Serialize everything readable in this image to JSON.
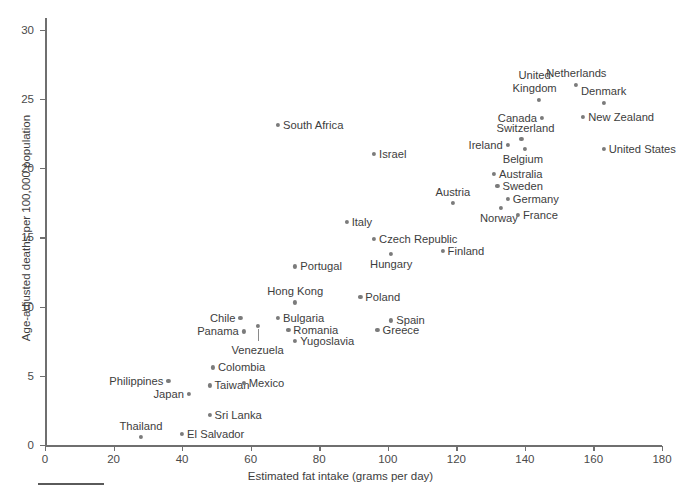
{
  "chart_data": {
    "type": "scatter",
    "title": "",
    "xlabel": "Estimated fat intake (grams per day)",
    "ylabel": "Age-adjusted deaths per 100,000 population",
    "xlim": [
      0,
      180
    ],
    "ylim": [
      0,
      31
    ],
    "xticks": [
      0,
      20,
      40,
      60,
      80,
      100,
      120,
      140,
      160,
      180
    ],
    "yticks": [
      0,
      5,
      10,
      15,
      20,
      25,
      30
    ],
    "xtick_labels": [
      "0",
      "20",
      "40",
      "60",
      "80",
      "100",
      "120",
      "140",
      "160",
      "180"
    ],
    "ytick_labels": [
      "0",
      "5",
      "10",
      "15",
      "20",
      "25",
      "30"
    ],
    "grid": false,
    "legend": false,
    "point_color": "#7b7b7b",
    "axis_color": "#6f6f6f",
    "points": [
      {
        "name": "Netherlands",
        "x": 155,
        "y": 26.0,
        "label_pos": "above",
        "label_dx": 0,
        "label_dy": -6
      },
      {
        "name": "Denmark",
        "x": 163,
        "y": 24.7,
        "label_pos": "above",
        "label_dx": 0,
        "label_dy": -6
      },
      {
        "name": "United Kingdom",
        "x": 144,
        "y": 24.9,
        "label_pos": "above",
        "label_dx": -4,
        "label_dy": -6
      },
      {
        "name": "New Zealand",
        "x": 157,
        "y": 23.7,
        "label_pos": "right",
        "label_dx": 5,
        "label_dy": 0
      },
      {
        "name": "Canada",
        "x": 145,
        "y": 23.6,
        "label_pos": "left",
        "label_dx": -5,
        "label_dy": 0
      },
      {
        "name": "South Africa",
        "x": 68,
        "y": 23.1,
        "label_pos": "right",
        "label_dx": 5,
        "label_dy": 0
      },
      {
        "name": "Switzerland",
        "x": 139,
        "y": 22.1,
        "label_pos": "above",
        "label_dx": 4,
        "label_dy": -5
      },
      {
        "name": "Ireland",
        "x": 135,
        "y": 21.7,
        "label_pos": "left",
        "label_dx": -5,
        "label_dy": 0
      },
      {
        "name": "United States",
        "x": 163,
        "y": 21.4,
        "label_pos": "right",
        "label_dx": 5,
        "label_dy": 0
      },
      {
        "name": "Belgium",
        "x": 140,
        "y": 21.4,
        "label_pos": "below",
        "label_dx": -2,
        "label_dy": 4
      },
      {
        "name": "Israel",
        "x": 96,
        "y": 21.0,
        "label_pos": "right",
        "label_dx": 5,
        "label_dy": 0
      },
      {
        "name": "Australia",
        "x": 131,
        "y": 19.6,
        "label_pos": "right",
        "label_dx": 5,
        "label_dy": 0
      },
      {
        "name": "Sweden",
        "x": 132,
        "y": 18.7,
        "label_pos": "right",
        "label_dx": 5,
        "label_dy": 0
      },
      {
        "name": "Germany",
        "x": 135,
        "y": 17.8,
        "label_pos": "right",
        "label_dx": 5,
        "label_dy": 0
      },
      {
        "name": "Austria",
        "x": 119,
        "y": 17.5,
        "label_pos": "above",
        "label_dx": 0,
        "label_dy": -5
      },
      {
        "name": "Norway",
        "x": 133,
        "y": 17.1,
        "label_pos": "below",
        "label_dx": -2,
        "label_dy": 4
      },
      {
        "name": "France",
        "x": 138,
        "y": 16.6,
        "label_pos": "right",
        "label_dx": 5,
        "label_dy": 0
      },
      {
        "name": "Italy",
        "x": 88,
        "y": 16.1,
        "label_pos": "right",
        "label_dx": 5,
        "label_dy": 0
      },
      {
        "name": "Czech Republic",
        "x": 96,
        "y": 14.9,
        "label_pos": "right",
        "label_dx": 5,
        "label_dy": 0
      },
      {
        "name": "Finland",
        "x": 116,
        "y": 14.0,
        "label_pos": "right",
        "label_dx": 5,
        "label_dy": 0
      },
      {
        "name": "Hungary",
        "x": 101,
        "y": 13.8,
        "label_pos": "below",
        "label_dx": 0,
        "label_dy": 4
      },
      {
        "name": "Portugal",
        "x": 73,
        "y": 12.9,
        "label_pos": "right",
        "label_dx": 5,
        "label_dy": 0
      },
      {
        "name": "Poland",
        "x": 92,
        "y": 10.7,
        "label_pos": "right",
        "label_dx": 5,
        "label_dy": 0
      },
      {
        "name": "Hong Kong",
        "x": 73,
        "y": 10.3,
        "label_pos": "above",
        "label_dx": 0,
        "label_dy": -5
      },
      {
        "name": "Spain",
        "x": 101,
        "y": 9.0,
        "label_pos": "right",
        "label_dx": 5,
        "label_dy": 0
      },
      {
        "name": "Bulgaria",
        "x": 68,
        "y": 9.2,
        "label_pos": "right",
        "label_dx": 5,
        "label_dy": 0
      },
      {
        "name": "Chile",
        "x": 57,
        "y": 9.2,
        "label_pos": "left",
        "label_dx": -5,
        "label_dy": 0
      },
      {
        "name": "Greece",
        "x": 97,
        "y": 8.3,
        "label_pos": "right",
        "label_dx": 5,
        "label_dy": 0
      },
      {
        "name": "Romania",
        "x": 71,
        "y": 8.3,
        "label_pos": "right",
        "label_dx": 5,
        "label_dy": 0
      },
      {
        "name": "Panama",
        "x": 58,
        "y": 8.2,
        "label_pos": "left",
        "label_dx": -5,
        "label_dy": 0
      },
      {
        "name": "Yugoslavia",
        "x": 73,
        "y": 7.5,
        "label_pos": "right",
        "label_dx": 5,
        "label_dy": 0
      },
      {
        "name": "Venezuela",
        "x": 62,
        "y": 8.6,
        "label_pos": "below",
        "label_dx": 0,
        "label_dy": 18,
        "leader": true
      },
      {
        "name": "Colombia",
        "x": 49,
        "y": 5.6,
        "label_pos": "right",
        "label_dx": 5,
        "label_dy": 0
      },
      {
        "name": "Philippines",
        "x": 36,
        "y": 4.6,
        "label_pos": "left",
        "label_dx": -5,
        "label_dy": 0
      },
      {
        "name": "Taiwan",
        "x": 48,
        "y": 4.3,
        "label_pos": "right",
        "label_dx": 5,
        "label_dy": 0
      },
      {
        "name": "Mexico",
        "x": 58,
        "y": 4.5,
        "label_pos": "right",
        "label_dx": 5,
        "label_dy": 0
      },
      {
        "name": "Japan",
        "x": 42,
        "y": 3.7,
        "label_pos": "left",
        "label_dx": -5,
        "label_dy": 0
      },
      {
        "name": "Sri Lanka",
        "x": 48,
        "y": 2.2,
        "label_pos": "right",
        "label_dx": 5,
        "label_dy": 0
      },
      {
        "name": "El Salvador",
        "x": 40,
        "y": 0.8,
        "label_pos": "right",
        "label_dx": 5,
        "label_dy": 0
      },
      {
        "name": "Thailand",
        "x": 28,
        "y": 0.6,
        "label_pos": "above",
        "label_dx": 0,
        "label_dy": -5
      }
    ]
  }
}
